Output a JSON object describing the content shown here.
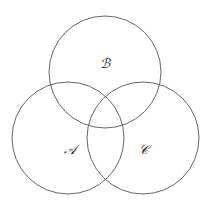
{
  "diagram": {
    "type": "venn",
    "stroke_color": "#555555",
    "sets": [
      {
        "id": "B",
        "label": "ℬ",
        "cx": 105,
        "cy": 72,
        "r": 56
      },
      {
        "id": "A",
        "label": "𝒜",
        "cx": 68,
        "cy": 138,
        "r": 56
      },
      {
        "id": "C",
        "label": "𝒞",
        "cx": 143,
        "cy": 138,
        "r": 56
      }
    ]
  }
}
